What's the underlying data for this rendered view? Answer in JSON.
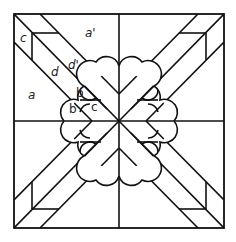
{
  "figure": {
    "type": "quilt-block-pattern",
    "stroke_color": "#111111",
    "background": "#ffffff",
    "labels": [
      {
        "id": "c-top",
        "text": "c",
        "x": 20,
        "y": 32
      },
      {
        "id": "a-prime",
        "text": "a'",
        "x": 85,
        "y": 27
      },
      {
        "id": "d-prime",
        "text": "d'",
        "x": 68,
        "y": 59
      },
      {
        "id": "d",
        "text": "d",
        "x": 51,
        "y": 66
      },
      {
        "id": "a",
        "text": "a",
        "x": 28,
        "y": 89
      },
      {
        "id": "b-upper",
        "text": "b",
        "x": 76,
        "y": 87
      },
      {
        "id": "b-lower",
        "text": "b",
        "x": 69,
        "y": 103
      },
      {
        "id": "c-center",
        "text": "c",
        "x": 91,
        "y": 101
      }
    ]
  }
}
